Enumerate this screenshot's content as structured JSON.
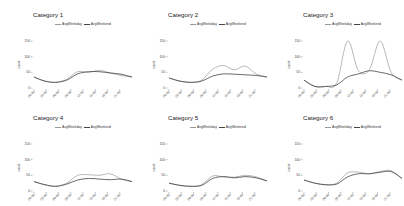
{
  "chart_data": [
    {
      "type": "line",
      "title": "Category 1",
      "xlabel": "",
      "ylabel": "count",
      "x": [
        "00:00",
        "03:00",
        "06:00",
        "09:00",
        "12:00",
        "15:00",
        "18:00",
        "21:00",
        "23:59"
      ],
      "ylim": [
        0,
        150
      ],
      "yticks": [
        0,
        50,
        100,
        150
      ],
      "legend": [
        "AvgWeekday",
        "AvgWeekend"
      ],
      "legend_position": "top",
      "grid": false,
      "series": [
        {
          "name": "AvgWeekday",
          "color": "#9a9a9a",
          "values": [
            35,
            22,
            18,
            28,
            52,
            50,
            56,
            48,
            40,
            35
          ]
        },
        {
          "name": "AvgWeekend",
          "color": "#444444",
          "values": [
            35,
            22,
            18,
            25,
            45,
            52,
            52,
            48,
            44,
            35
          ]
        }
      ]
    },
    {
      "type": "line",
      "title": "Category 2",
      "xlabel": "",
      "ylabel": "count",
      "x": [
        "00:00",
        "03:00",
        "06:00",
        "09:00",
        "12:00",
        "15:00",
        "18:00",
        "21:00",
        "23:59"
      ],
      "ylim": [
        0,
        150
      ],
      "yticks": [
        0,
        50,
        100,
        150
      ],
      "legend": [
        "AvgWeekday",
        "AvgWeekend"
      ],
      "legend_position": "top",
      "grid": false,
      "series": [
        {
          "name": "AvgWeekday",
          "color": "#9a9a9a",
          "values": [
            32,
            22,
            18,
            25,
            60,
            72,
            58,
            70,
            45,
            35
          ]
        },
        {
          "name": "AvgWeekend",
          "color": "#444444",
          "values": [
            32,
            22,
            18,
            22,
            38,
            45,
            44,
            42,
            40,
            35
          ]
        }
      ]
    },
    {
      "type": "line",
      "title": "Category 3",
      "xlabel": "",
      "ylabel": "count",
      "x": [
        "00:00",
        "03:00",
        "06:00",
        "09:00",
        "12:00",
        "15:00",
        "18:00",
        "21:00",
        "23:59"
      ],
      "ylim": [
        0,
        150
      ],
      "yticks": [
        0,
        50,
        100,
        150
      ],
      "legend": [
        "AvgWeekday",
        "AvgWeekend"
      ],
      "legend_position": "top",
      "grid": false,
      "series": [
        {
          "name": "AvgWeekday",
          "color": "#9a9a9a",
          "values": [
            25,
            5,
            5,
            15,
            150,
            55,
            58,
            150,
            50,
            25
          ]
        },
        {
          "name": "AvgWeekend",
          "color": "#444444",
          "values": [
            25,
            5,
            5,
            10,
            35,
            45,
            55,
            50,
            42,
            25
          ]
        }
      ]
    },
    {
      "type": "line",
      "title": "Category 4",
      "xlabel": "",
      "ylabel": "count",
      "x": [
        "00:00",
        "03:00",
        "06:00",
        "09:00",
        "12:00",
        "15:00",
        "18:00",
        "21:00",
        "23:59"
      ],
      "ylim": [
        0,
        150
      ],
      "yticks": [
        0,
        50,
        100,
        150
      ],
      "legend": [
        "AvgWeekday",
        "AvgWeekend"
      ],
      "legend_position": "top",
      "grid": false,
      "series": [
        {
          "name": "AvgWeekday",
          "color": "#9a9a9a",
          "values": [
            30,
            20,
            15,
            25,
            50,
            52,
            50,
            55,
            38,
            30
          ]
        },
        {
          "name": "AvgWeekend",
          "color": "#444444",
          "values": [
            30,
            20,
            15,
            22,
            35,
            40,
            38,
            36,
            38,
            30
          ]
        }
      ]
    },
    {
      "type": "line",
      "title": "Category 5",
      "xlabel": "",
      "ylabel": "count",
      "x": [
        "00:00",
        "03:00",
        "06:00",
        "09:00",
        "12:00",
        "15:00",
        "18:00",
        "21:00",
        "23:59"
      ],
      "ylim": [
        0,
        150
      ],
      "yticks": [
        0,
        50,
        100,
        150
      ],
      "legend": [
        "AvgWeekday",
        "AvgWeekend"
      ],
      "legend_position": "top",
      "grid": false,
      "series": [
        {
          "name": "AvgWeekday",
          "color": "#9a9a9a",
          "values": [
            25,
            18,
            15,
            20,
            48,
            45,
            44,
            50,
            45,
            32
          ]
        },
        {
          "name": "AvgWeekend",
          "color": "#444444",
          "values": [
            25,
            18,
            15,
            18,
            40,
            46,
            42,
            46,
            42,
            32
          ]
        }
      ]
    },
    {
      "type": "line",
      "title": "Category 6",
      "xlabel": "",
      "ylabel": "count",
      "x": [
        "00:00",
        "03:00",
        "06:00",
        "09:00",
        "12:00",
        "15:00",
        "18:00",
        "21:00",
        "23:59"
      ],
      "ylim": [
        0,
        150
      ],
      "yticks": [
        0,
        50,
        100,
        150
      ],
      "legend": [
        "AvgWeekday",
        "AvgWeekend"
      ],
      "legend_position": "top",
      "grid": false,
      "series": [
        {
          "name": "AvgWeekday",
          "color": "#9a9a9a",
          "values": [
            35,
            25,
            20,
            25,
            58,
            60,
            55,
            62,
            65,
            40
          ]
        },
        {
          "name": "AvgWeekend",
          "color": "#444444",
          "values": [
            35,
            25,
            20,
            22,
            45,
            55,
            55,
            60,
            62,
            40
          ]
        }
      ]
    }
  ],
  "panels": [
    {
      "title": "Category 1"
    },
    {
      "title": "Category 2"
    },
    {
      "title": "Category 3"
    },
    {
      "title": "Category 4"
    },
    {
      "title": "Category 5"
    },
    {
      "title": "Category 6"
    }
  ],
  "legend": {
    "weekday": "AvgWeekday",
    "weekend": "AvgWeekend"
  },
  "axis": {
    "ylabel": "count",
    "yticks": [
      "0",
      "50",
      "100",
      "150"
    ],
    "xticks": [
      "00:00",
      "03:00",
      "06:00",
      "09:00",
      "12:00",
      "15:00",
      "18:00",
      "21:00"
    ]
  }
}
